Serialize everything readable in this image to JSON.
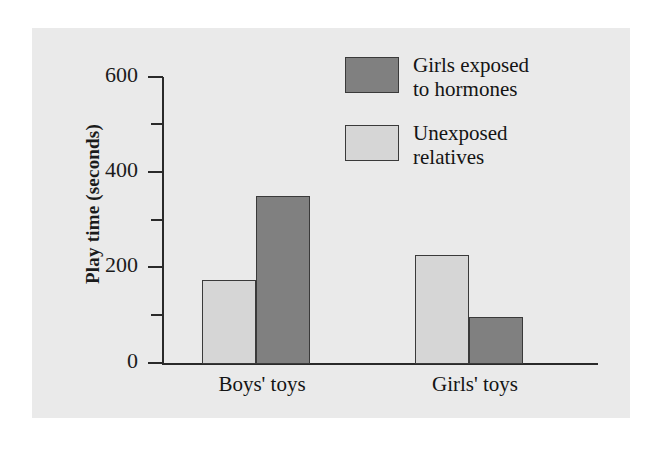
{
  "figure": {
    "background_color": "#eaeaea",
    "page_background_color": "#ffffff"
  },
  "axis": {
    "y_title": "Play time (seconds)",
    "tick_labels": [
      "0",
      "200",
      "400",
      "600"
    ],
    "minor_ticks": [
      100,
      300,
      500
    ]
  },
  "legend": {
    "entries": [
      {
        "label": "Girls exposed\nto hormones",
        "color": "#808080"
      },
      {
        "label": "Unexposed\nrelatives",
        "color": "#d6d6d6"
      }
    ]
  },
  "chart_data": {
    "type": "bar",
    "title": "",
    "xlabel": "",
    "ylabel": "Play time (seconds)",
    "ylim": [
      0,
      600
    ],
    "yticks": [
      0,
      100,
      200,
      300,
      400,
      500,
      600
    ],
    "ytick_labels": [
      "0",
      "",
      "200",
      "",
      "400",
      "",
      "600"
    ],
    "grid": false,
    "legend_position": "top-right",
    "categories": [
      "Boys' toys",
      "Girls' toys"
    ],
    "series": [
      {
        "name": "Unexposed relatives",
        "color": "#d6d6d6",
        "values": [
          174,
          228
        ]
      },
      {
        "name": "Girls exposed to hormones",
        "color": "#808080",
        "values": [
          349,
          98
        ]
      }
    ],
    "bar_order_within_group": [
      "Unexposed relatives",
      "Girls exposed to hormones"
    ]
  }
}
